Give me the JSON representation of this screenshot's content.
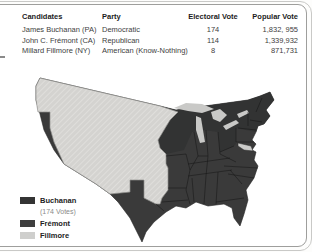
{
  "figure": {
    "name": "Presidential election of 1856 results map"
  },
  "table": {
    "headers": {
      "candidates": "Candidates",
      "party": "Party",
      "electoral": "Electoral Vote",
      "popular": "Popular Vote"
    },
    "rows": [
      {
        "candidate": "James Buchanan (PA)",
        "party": "Democratic",
        "electoral": "174",
        "popular": "1,832, 955"
      },
      {
        "candidate": "John C. Frémont (CA)",
        "party": "Republican",
        "electoral": "114",
        "popular": "1,339,932"
      },
      {
        "candidate": "Millard Fillmore (NY)",
        "party": "American (Know-Nothing)",
        "electoral": "8",
        "popular": "871,731"
      }
    ]
  },
  "legend": {
    "items": [
      {
        "label": "Buchanan",
        "note": "(174 Votes)",
        "swatch_style": "background:#343434"
      },
      {
        "label": "Frémont",
        "swatch_style": "background:#3e3e3e"
      },
      {
        "label": "Fillmore",
        "swatch_style": "background:#cfcfcd"
      }
    ]
  },
  "map": {
    "colors": {
      "buchanan": "#3a3a3a",
      "fremont": "#323333",
      "territory": "#d4d3d0",
      "territory_hatch": "#e9e8e4",
      "lakes": "#c9c9c7",
      "fillmore": "#cbcbc9",
      "state_border": "#141414"
    }
  }
}
